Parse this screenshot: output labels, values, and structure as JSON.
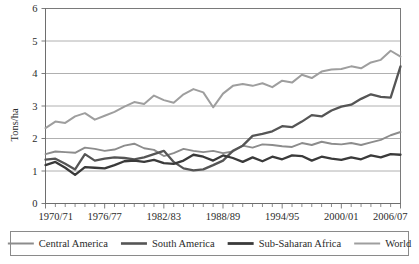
{
  "chart_data": {
    "type": "line",
    "title": "",
    "xlabel": "",
    "ylabel": "Tons/ha",
    "ylim": [
      0,
      6
    ],
    "yticks": [
      0,
      1,
      2,
      3,
      4,
      5,
      6
    ],
    "ytick_labels": [
      "0",
      "1",
      "2",
      "3",
      "4",
      "5",
      "6"
    ],
    "grid": true,
    "grid_axis": "y",
    "legend_position": "bottom",
    "x": [
      "1970/71",
      "1971/72",
      "1972/73",
      "1973/74",
      "1974/75",
      "1975/76",
      "1976/77",
      "1977/78",
      "1978/79",
      "1979/80",
      "1980/81",
      "1981/82",
      "1982/83",
      "1983/84",
      "1984/85",
      "1985/86",
      "1986/87",
      "1987/88",
      "1988/89",
      "1989/90",
      "1990/91",
      "1991/92",
      "1992/93",
      "1993/94",
      "1994/95",
      "1995/96",
      "1996/97",
      "1997/98",
      "1998/99",
      "1999/00",
      "2000/01",
      "2001/02",
      "2002/03",
      "2003/04",
      "2004/05",
      "2005/06",
      "2006/07"
    ],
    "xtick_labels_shown": [
      "1970/71",
      "1976/77",
      "1982/83",
      "1988/89",
      "1994/95",
      "2000/01",
      "2006/07"
    ],
    "xtick_label_indices": [
      0,
      6,
      12,
      18,
      24,
      30,
      36
    ],
    "series": [
      {
        "name": "Central America",
        "color": "#8c8c8c",
        "width": 1.9,
        "values": [
          1.52,
          1.6,
          1.58,
          1.56,
          1.72,
          1.68,
          1.62,
          1.66,
          1.78,
          1.84,
          1.7,
          1.65,
          1.46,
          1.55,
          1.68,
          1.62,
          1.58,
          1.62,
          1.55,
          1.6,
          1.78,
          1.72,
          1.82,
          1.8,
          1.76,
          1.74,
          1.86,
          1.8,
          1.9,
          1.84,
          1.82,
          1.86,
          1.8,
          1.88,
          1.96,
          2.1,
          2.2
        ]
      },
      {
        "name": "South America",
        "color": "#555555",
        "width": 2.3,
        "values": [
          1.35,
          1.38,
          1.22,
          1.05,
          1.52,
          1.32,
          1.38,
          1.42,
          1.4,
          1.36,
          1.42,
          1.52,
          1.62,
          1.28,
          1.08,
          1.02,
          1.05,
          1.18,
          1.32,
          1.62,
          1.78,
          2.08,
          2.14,
          2.22,
          2.38,
          2.35,
          2.52,
          2.72,
          2.68,
          2.86,
          2.98,
          3.04,
          3.22,
          3.36,
          3.28,
          3.26,
          4.22
        ]
      },
      {
        "name": "Sub-Saharan Africa",
        "color": "#3a3a3a",
        "width": 2.3,
        "values": [
          1.18,
          1.28,
          1.1,
          0.88,
          1.12,
          1.1,
          1.08,
          1.18,
          1.3,
          1.32,
          1.28,
          1.34,
          1.24,
          1.22,
          1.32,
          1.5,
          1.44,
          1.32,
          1.48,
          1.4,
          1.28,
          1.42,
          1.3,
          1.44,
          1.36,
          1.48,
          1.46,
          1.32,
          1.44,
          1.38,
          1.34,
          1.42,
          1.36,
          1.48,
          1.42,
          1.52,
          1.5
        ]
      },
      {
        "name": "World",
        "color": "#9e9e9e",
        "width": 2.0,
        "values": [
          2.32,
          2.52,
          2.48,
          2.68,
          2.78,
          2.58,
          2.7,
          2.82,
          2.98,
          3.12,
          3.06,
          3.32,
          3.18,
          3.1,
          3.36,
          3.52,
          3.42,
          2.96,
          3.38,
          3.62,
          3.68,
          3.62,
          3.7,
          3.58,
          3.78,
          3.72,
          3.96,
          3.86,
          4.06,
          4.12,
          4.14,
          4.22,
          4.16,
          4.34,
          4.42,
          4.7,
          4.52
        ]
      }
    ]
  },
  "axis": {
    "y_title": "Tons/ha"
  },
  "legend": {
    "items": [
      {
        "label": "Central America",
        "color": "#8c8c8c",
        "width": 2.0
      },
      {
        "label": "South America",
        "color": "#555555",
        "width": 2.6
      },
      {
        "label": "Sub-Saharan Africa",
        "color": "#3a3a3a",
        "width": 2.8
      },
      {
        "label": "World",
        "color": "#9e9e9e",
        "width": 2.0
      }
    ]
  }
}
